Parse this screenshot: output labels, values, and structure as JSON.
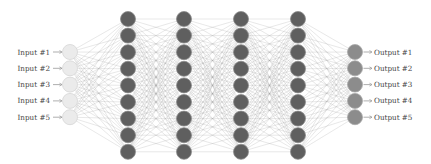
{
  "diagram": {
    "type": "neural-network",
    "layers": [
      {
        "name": "input",
        "size": 5,
        "x": 70,
        "y_start": 52,
        "y_step": 16.3,
        "fill": "#ebebeb",
        "stroke": "#d6d6d6"
      },
      {
        "name": "hidden-1",
        "size": 9,
        "x": 128,
        "y_start": 19,
        "y_step": 16.6,
        "fill": "#5f5f5f",
        "stroke": "#8a8a8a"
      },
      {
        "name": "hidden-2",
        "size": 9,
        "x": 184,
        "y_start": 19,
        "y_step": 16.6,
        "fill": "#5f5f5f",
        "stroke": "#8a8a8a"
      },
      {
        "name": "hidden-3",
        "size": 9,
        "x": 241,
        "y_start": 19,
        "y_step": 16.6,
        "fill": "#5f5f5f",
        "stroke": "#8a8a8a"
      },
      {
        "name": "hidden-4",
        "size": 9,
        "x": 298,
        "y_start": 19,
        "y_step": 16.6,
        "fill": "#5f5f5f",
        "stroke": "#8a8a8a"
      },
      {
        "name": "output",
        "size": 5,
        "x": 355,
        "y_start": 52,
        "y_step": 16.3,
        "fill": "#8c8c8c",
        "stroke": "#a8a8a8"
      }
    ],
    "node_radius": 7.5,
    "edge_color": "#9a9a9a",
    "edge_opacity": 0.45,
    "inputs": [
      "Input #1",
      "Input #2",
      "Input #3",
      "Input #4",
      "Input #5"
    ],
    "outputs": [
      "Output #1",
      "Output #2",
      "Output #3",
      "Output #4",
      "Output #5"
    ],
    "label_color": "#444444",
    "arrow_color": "#777777"
  }
}
